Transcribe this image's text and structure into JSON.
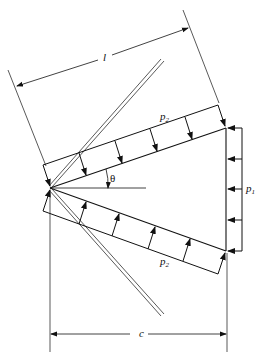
{
  "diagram": {
    "labels": {
      "length": "l",
      "chord": "c",
      "angle": "θ",
      "p2_upper": "p",
      "p2_upper_sub": "2",
      "p2_lower": "p",
      "p2_lower_sub": "2",
      "p1": "p",
      "p1_sub": "1"
    },
    "colors": {
      "line": "#111111",
      "background": "#ffffff"
    }
  }
}
